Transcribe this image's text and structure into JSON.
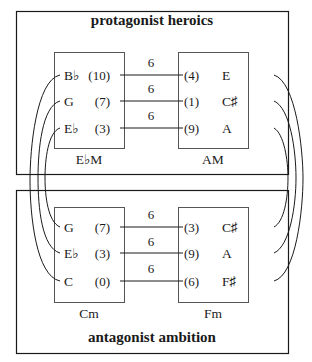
{
  "diagram": {
    "top_panel": {
      "title": "protagonist heroics",
      "left_chord": {
        "label": "E♭M",
        "notes": [
          {
            "name": "B♭",
            "pc": "(10)"
          },
          {
            "name": "G",
            "pc": "(7)"
          },
          {
            "name": "E♭",
            "pc": "(3)"
          }
        ]
      },
      "right_chord": {
        "label": "AM",
        "notes": [
          {
            "name": "E",
            "pc": "(4)"
          },
          {
            "name": "C♯",
            "pc": "(1)"
          },
          {
            "name": "A",
            "pc": "(9)"
          }
        ]
      },
      "intervals": [
        "6",
        "6",
        "6"
      ]
    },
    "bottom_panel": {
      "title": "antagonist ambition",
      "left_chord": {
        "label": "Cm",
        "notes": [
          {
            "name": "G",
            "pc": "(7)"
          },
          {
            "name": "E♭",
            "pc": "(3)"
          },
          {
            "name": "C",
            "pc": "(0)"
          }
        ]
      },
      "right_chord": {
        "label": "Fm",
        "notes": [
          {
            "name": "C♯",
            "pc": "(3)"
          },
          {
            "name": "A",
            "pc": "(9)"
          },
          {
            "name": "F♯",
            "pc": "(6)"
          }
        ]
      },
      "intervals": [
        "6",
        "6",
        "6"
      ]
    },
    "colors": {
      "ink": "#1a1a1a",
      "background": "#ffffff"
    }
  }
}
